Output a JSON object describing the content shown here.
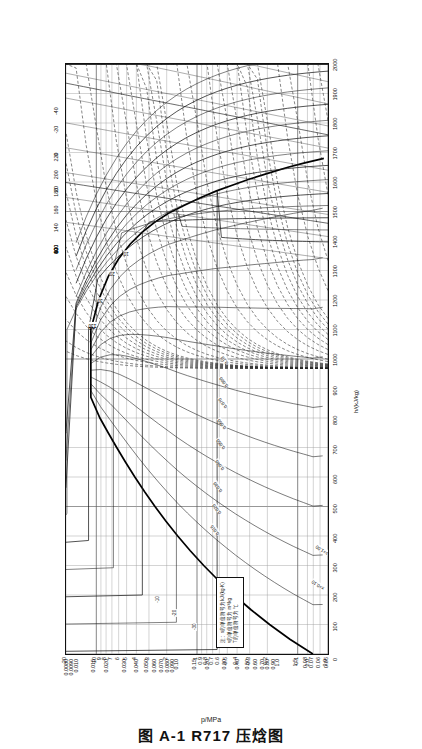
{
  "figure": {
    "caption": "图 A-1    R717 压焓图",
    "caption_id": "图 A-1",
    "refrigerant": "R717",
    "caption_title": "压焓图",
    "pressure_axis_title": "p/MPa",
    "enthalpy_axis_title": "h/(kJ/kg)"
  },
  "legend_note": {
    "line1": "注：s的单位符号为kJ/(kg·K)",
    "line2": "v的单位符号为 m³/kg",
    "line3": "T的单位符号为 ℃"
  },
  "labels": {
    "quality_prefix": "x=",
    "entropy_prefix": "s=",
    "x_010": "x=0.10",
    "s_100": "s=1.00"
  },
  "chart_data": {
    "type": "line",
    "title": "R717 压焓图",
    "subtitle": "Pressure–Enthalpy diagram for ammonia (R717)",
    "xlabel": "h/(kJ/kg)",
    "ylabel": "p/MPa",
    "xlim": [
      0,
      2000
    ],
    "ylim": [
      0.05,
      20
    ],
    "yscale": "log",
    "grid": true,
    "legend_position": "inset-lower-left",
    "x_ticks": [
      0,
      100,
      200,
      300,
      400,
      500,
      600,
      700,
      800,
      900,
      1000,
      1100,
      1200,
      1300,
      1400,
      1500,
      1600,
      1700,
      1800,
      1900,
      2000
    ],
    "x_tick_labels": [
      "0",
      "100",
      "200",
      "300",
      "400",
      "500",
      "600",
      "700",
      "800",
      "900",
      "1000",
      "1100",
      "1200",
      "1300",
      "1400",
      "1500",
      "1600",
      "1700",
      "1800",
      "1900",
      "2000"
    ],
    "y_ticks": [
      0.05,
      0.06,
      0.07,
      0.08,
      0.1,
      0.2,
      0.3,
      0.4,
      0.5,
      0.6,
      0.7,
      0.8,
      0.9,
      1,
      2,
      3,
      4,
      5,
      6,
      7,
      8,
      9,
      10,
      20
    ],
    "y_tick_labels": [
      "0.05",
      "0.06",
      "0.07",
      "0.08",
      "0.1",
      "0.2",
      "0.3",
      "0.4",
      "0.5",
      "0.6",
      "0.7",
      "0.8",
      "0.9",
      "1",
      "2",
      "3",
      "4",
      "5",
      "6",
      "7",
      "8",
      "9",
      "10",
      "20"
    ],
    "isotherms_C": [
      -40,
      -20,
      0,
      20,
      40,
      60,
      80,
      100,
      120,
      140,
      160,
      180,
      200,
      220
    ],
    "isotherm_top_labels": [
      "-40",
      "-20",
      "0",
      "20",
      "40",
      "60",
      "80",
      "100",
      "120",
      "140",
      "160",
      "180",
      "200",
      "220"
    ],
    "dome_temperature_labels": [
      "10",
      "20",
      "30",
      "40",
      "50",
      "60",
      "70",
      "80",
      "90",
      "100",
      "110",
      "120",
      "130"
    ],
    "isochores_m3kg": [
      "0.0015",
      "0.0020",
      "0.0030",
      "0.0040",
      "0.0050",
      "0.0060",
      "0.0070",
      "0.0080",
      "0.0090",
      "0.010",
      "0.015",
      "0.020",
      "0.030",
      "0.040",
      "0.050",
      "0.060",
      "0.070",
      "0.080",
      "0.090",
      "0.10",
      "0.15",
      "0.20",
      "0.30",
      "0.40",
      "0.50",
      "0.60",
      "0.70",
      "0.80",
      "0.90",
      "1.0",
      "1.5",
      "2.0",
      "3.0",
      "4.0"
    ],
    "isentropes_kJkgK": [
      "1.00",
      "2.00",
      "3.00",
      "4.00",
      "5.00",
      "6.00"
    ],
    "quality_lines": [
      "0.10",
      "0.20",
      "0.30",
      "0.40",
      "0.50",
      "0.60",
      "0.70",
      "0.80",
      "0.90"
    ],
    "critical_point": {
      "h": 1100,
      "p": 11.33,
      "T": 132.3
    },
    "saturation_liquid": [
      {
        "h": 0,
        "p": 0.0706
      },
      {
        "h": 50,
        "p": 0.1195
      },
      {
        "h": 100,
        "p": 0.1902
      },
      {
        "h": 150,
        "p": 0.2909
      },
      {
        "h": 200,
        "p": 0.4294
      },
      {
        "h": 250,
        "p": 0.615
      },
      {
        "h": 300,
        "p": 0.8575
      },
      {
        "h": 350,
        "p": 1.167
      },
      {
        "h": 400,
        "p": 1.555
      },
      {
        "h": 450,
        "p": 2.033
      },
      {
        "h": 500,
        "p": 2.614
      },
      {
        "h": 550,
        "p": 3.312
      },
      {
        "h": 600,
        "p": 4.142
      },
      {
        "h": 650,
        "p": 5.123
      },
      {
        "h": 700,
        "p": 6.275
      },
      {
        "h": 750,
        "p": 7.625
      },
      {
        "h": 800,
        "p": 9.206
      },
      {
        "h": 870,
        "p": 11.33
      }
    ],
    "saturation_vapor": [
      {
        "h": 1100,
        "p": 11.33
      },
      {
        "h": 1200,
        "p": 9.5
      },
      {
        "h": 1280,
        "p": 7.6
      },
      {
        "h": 1340,
        "p": 6.0
      },
      {
        "h": 1390,
        "p": 4.6
      },
      {
        "h": 1430,
        "p": 3.5
      },
      {
        "h": 1465,
        "p": 2.6
      },
      {
        "h": 1495,
        "p": 1.9
      },
      {
        "h": 1520,
        "p": 1.35
      },
      {
        "h": 1545,
        "p": 0.95
      },
      {
        "h": 1570,
        "p": 0.64
      },
      {
        "h": 1590,
        "p": 0.44
      },
      {
        "h": 1610,
        "p": 0.3
      },
      {
        "h": 1630,
        "p": 0.195
      },
      {
        "h": 1650,
        "p": 0.125
      },
      {
        "h": 1665,
        "p": 0.085
      },
      {
        "h": 1680,
        "p": 0.055
      }
    ]
  }
}
